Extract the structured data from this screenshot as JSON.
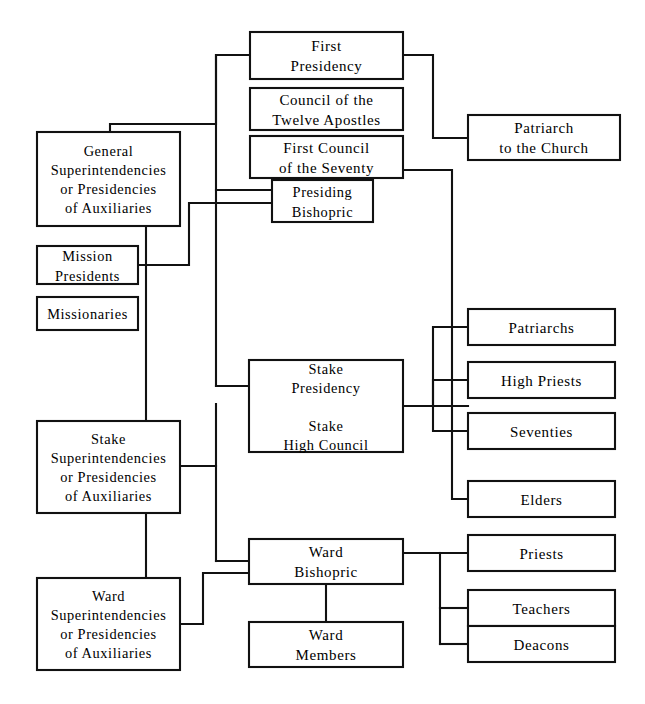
{
  "chart_data": {
    "type": "diagram",
    "diagram_kind": "organizational-chart",
    "orientation": "left-to-right hierarchy with central trunk",
    "colors": {
      "background": "#ffffff",
      "line": "#111111",
      "box_fill": "#ffffff",
      "text": "#000000"
    },
    "nodes": [
      {
        "id": "first-presidency",
        "label": "First Presidency",
        "lines": [
          "First",
          "Presidency"
        ],
        "x": 250,
        "y": 32,
        "w": 153,
        "h": 47,
        "column": "center",
        "level": 1
      },
      {
        "id": "council-twelve-apostles",
        "label": "Council of the Twelve Apostles",
        "lines": [
          "Council of the",
          "Twelve Apostles"
        ],
        "x": 250,
        "y": 88,
        "w": 153,
        "h": 42,
        "column": "center",
        "level": 2
      },
      {
        "id": "first-council-seventy",
        "label": "First Council of the Seventy",
        "lines": [
          "First Council",
          "of the Seventy"
        ],
        "x": 250,
        "y": 136,
        "w": 153,
        "h": 42,
        "column": "center",
        "level": 2
      },
      {
        "id": "presiding-bishopric",
        "label": "Presiding Bishopric",
        "lines": [
          "Presiding",
          "Bishopric"
        ],
        "x": 272,
        "y": 180,
        "w": 101,
        "h": 42,
        "column": "center",
        "level": 3
      },
      {
        "id": "patriarch-to-the-church",
        "label": "Patriarch to the Church",
        "lines": [
          "Patriarch",
          "to the Church"
        ],
        "x": 468,
        "y": 115,
        "w": 152,
        "h": 45,
        "column": "right",
        "level": 2
      },
      {
        "id": "general-auxiliaries",
        "label": "General Superintendencies or Presidencies of Auxiliaries",
        "lines": [
          "General",
          "Superintendencies",
          "or Presidencies",
          "of Auxiliaries"
        ],
        "x": 37,
        "y": 132,
        "w": 143,
        "h": 94,
        "column": "left",
        "level": 2
      },
      {
        "id": "mission-presidents",
        "label": "Mission Presidents",
        "lines": [
          "Mission",
          "Presidents"
        ],
        "x": 37,
        "y": 246,
        "w": 101,
        "h": 38,
        "column": "left",
        "level": 3
      },
      {
        "id": "missionaries",
        "label": "Missionaries",
        "lines": [
          "Missionaries"
        ],
        "x": 37,
        "y": 297,
        "w": 101,
        "h": 33,
        "column": "left",
        "level": 4
      },
      {
        "id": "patriarchs",
        "label": "Patriarchs",
        "lines": [
          "Patriarchs"
        ],
        "x": 468,
        "y": 309,
        "w": 147,
        "h": 36,
        "column": "right",
        "level": 3
      },
      {
        "id": "high-priests",
        "label": "High Priests",
        "lines": [
          "High Priests"
        ],
        "x": 468,
        "y": 362,
        "w": 147,
        "h": 36,
        "column": "right",
        "level": 3
      },
      {
        "id": "seventies",
        "label": "Seventies",
        "lines": [
          "Seventies"
        ],
        "x": 468,
        "y": 413,
        "w": 147,
        "h": 36,
        "column": "right",
        "level": 3
      },
      {
        "id": "elders",
        "label": "Elders",
        "lines": [
          "Elders"
        ],
        "x": 468,
        "y": 481,
        "w": 147,
        "h": 36,
        "column": "right",
        "level": 3
      },
      {
        "id": "stake-presidency",
        "label": "Stake Presidency Stake High Council",
        "lines": [
          "Stake",
          "Presidency",
          "",
          "Stake",
          "High Council"
        ],
        "x": 249,
        "y": 360,
        "w": 154,
        "h": 92,
        "column": "center",
        "level": 4
      },
      {
        "id": "stake-auxiliaries",
        "label": "Stake Superintendencies or Presidencies of Auxiliaries",
        "lines": [
          "Stake",
          "Superintendencies",
          "or Presidencies",
          "of Auxiliaries"
        ],
        "x": 37,
        "y": 421,
        "w": 143,
        "h": 92,
        "column": "left",
        "level": 4
      },
      {
        "id": "ward-bishopric",
        "label": "Ward Bishopric",
        "lines": [
          "Ward",
          "Bishopric"
        ],
        "x": 249,
        "y": 539,
        "w": 154,
        "h": 45,
        "column": "center",
        "level": 5
      },
      {
        "id": "ward-members",
        "label": "Ward Members",
        "lines": [
          "Ward",
          "Members"
        ],
        "x": 249,
        "y": 622,
        "w": 154,
        "h": 45,
        "column": "center",
        "level": 6
      },
      {
        "id": "ward-auxiliaries",
        "label": "Ward Superintendencies or Presidencies of Auxiliaries",
        "lines": [
          "Ward",
          "Superintendencies",
          "or Presidencies",
          "of Auxiliaries"
        ],
        "x": 37,
        "y": 578,
        "w": 143,
        "h": 92,
        "column": "left",
        "level": 5
      },
      {
        "id": "priests",
        "label": "Priests",
        "lines": [
          "Priests"
        ],
        "x": 468,
        "y": 535,
        "w": 147,
        "h": 36,
        "column": "right",
        "level": 6
      },
      {
        "id": "teachers",
        "label": "Teachers",
        "lines": [
          "Teachers"
        ],
        "x": 468,
        "y": 590,
        "w": 147,
        "h": 36,
        "column": "right",
        "level": 6
      },
      {
        "id": "deacons",
        "label": "Deacons",
        "lines": [
          "Deacons"
        ],
        "x": 468,
        "y": 626,
        "w": 147,
        "h": 36,
        "column": "right",
        "level": 6
      }
    ],
    "edges": [
      {
        "from": "first-presidency",
        "to": "general-auxiliaries",
        "path": "M250,55 L216,55 L216,124 L110,124 L110,132"
      },
      {
        "from": "first-presidency",
        "to": "patriarch-to-the-church",
        "path": "M403,55 L433,55 L433,138 L468,138"
      },
      {
        "from": "first-council-seventy",
        "to": "right-trunk",
        "path": "M403,170 L452,170 L452,428 L468,428"
      },
      {
        "from": "trunk-center",
        "to": "presiding-bishopric",
        "path": "M216,190 L272,190"
      },
      {
        "from": "mission-presidents",
        "to": "presiding-bishopric",
        "path": "M138,265 L189,265 L189,203 L272,203"
      },
      {
        "from": "general-auxiliaries",
        "to": "stake-auxiliaries",
        "path": "M146,226 L146,421"
      },
      {
        "from": "trunk-center-long",
        "to": "stake-presidency",
        "path": "M216,190 L216,386 L249,386"
      },
      {
        "from": "stake-auxiliaries",
        "to": "stake-presidency",
        "path": "M180,466 L216,466"
      },
      {
        "from": "stake-presidency",
        "to": "patriarchs",
        "path": "M403,406 L433,406 L433,327 L468,327"
      },
      {
        "from": "stake-presidency",
        "to": "high-priests",
        "path": "M403,406 L468,406 L468,380"
      },
      {
        "from": "stake-presidency",
        "to": "seventies",
        "path": "M433,406 L433,431 L468,431"
      },
      {
        "from": "first-council-seventy",
        "to": "elders",
        "path": "M452,499 L468,499"
      },
      {
        "from": "stake-auxiliaries",
        "to": "ward-auxiliaries",
        "path": "M146,513 L146,578"
      },
      {
        "from": "trunk-center",
        "to": "ward-bishopric",
        "path": "M216,561 L249,561"
      },
      {
        "from": "ward-auxiliaries",
        "to": "ward-bishopric",
        "path": "M180,624 L203,624 L203,573 L249,573"
      },
      {
        "from": "ward-bishopric",
        "to": "ward-members",
        "path": "M326,584 L326,622"
      },
      {
        "from": "ward-bishopric",
        "to": "priests",
        "path": "M403,553 L468,553"
      },
      {
        "from": "ward-bishopric",
        "to": "teachers",
        "path": "M440,553 L440,608 L468,608"
      },
      {
        "from": "ward-bishopric",
        "to": "deacons",
        "path": "M440,644 L468,644"
      }
    ]
  }
}
